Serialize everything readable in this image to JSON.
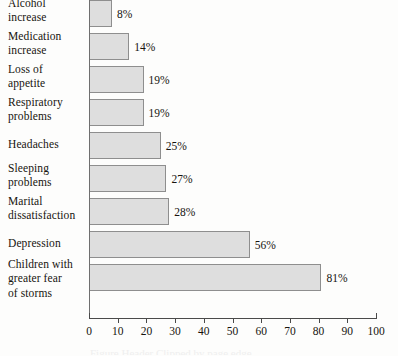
{
  "chart_data": {
    "type": "bar",
    "orientation": "horizontal",
    "title": "",
    "xlabel": "",
    "ylabel": "",
    "xlim": [
      0,
      100
    ],
    "xticks": [
      0,
      10,
      20,
      30,
      40,
      50,
      60,
      70,
      80,
      90,
      100
    ],
    "grid": false,
    "legend": null,
    "value_suffix": "%",
    "categories": [
      "Alcohol increase",
      "Medication increase",
      "Loss of appetite",
      "Respiratory problems",
      "Headaches",
      "Sleeping problems",
      "Marital dissatisfaction",
      "Depression",
      "Children with greater fear of storms"
    ],
    "values": [
      8,
      14,
      19,
      19,
      25,
      27,
      28,
      56,
      81
    ],
    "colors": {
      "bar_fill": "#dedede",
      "bar_stroke": "#8e8e8e",
      "axis": "#4a4a4a",
      "text": "#17140f",
      "background": "#fdfdfc"
    }
  },
  "rows": [
    {
      "label_lines": [
        "Alcohol",
        "increase"
      ],
      "value": 8,
      "value_label": "8%"
    },
    {
      "label_lines": [
        "Medication",
        "increase"
      ],
      "value": 14,
      "value_label": "14%"
    },
    {
      "label_lines": [
        "Loss of",
        "appetite"
      ],
      "value": 19,
      "value_label": "19%"
    },
    {
      "label_lines": [
        "Respiratory",
        "problems"
      ],
      "value": 19,
      "value_label": "19%"
    },
    {
      "label_lines": [
        "Headaches"
      ],
      "value": 25,
      "value_label": "25%"
    },
    {
      "label_lines": [
        "Sleeping",
        "problems"
      ],
      "value": 27,
      "value_label": "27%"
    },
    {
      "label_lines": [
        "Marital",
        "dissatisfaction"
      ],
      "value": 28,
      "value_label": "28%"
    },
    {
      "label_lines": [
        "Depression"
      ],
      "value": 56,
      "value_label": "56%"
    },
    {
      "label_lines": [
        "Children with",
        "greater fear",
        "of storms"
      ],
      "value": 81,
      "value_label": "81%"
    }
  ],
  "axis": {
    "tick_labels": [
      "0",
      "10",
      "20",
      "30",
      "40",
      "50",
      "60",
      "70",
      "80",
      "90",
      "100"
    ]
  },
  "footer": {
    "clipped_text": "Figure Header Clipped by page edge"
  }
}
